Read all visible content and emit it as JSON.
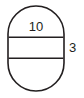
{
  "figure": {
    "shape_name": "stadium-oval",
    "stroke_color": "#231f20",
    "fill_color": "#ffffff",
    "background_color": "#ffffff",
    "stroke_width": 1.6,
    "geometry": {
      "left": 8,
      "right": 64,
      "top": 6,
      "bottom": 91,
      "width": 56,
      "height": 85,
      "cap_radius": 28,
      "band_top_y": 37,
      "band_bottom_y": 58,
      "band_height": 21
    },
    "labels": {
      "width_label": {
        "text": "10",
        "name": "width-dimension-label",
        "x": 36,
        "y": 28,
        "position": "inside-top"
      },
      "band_label": {
        "text": "3",
        "name": "band-height-dimension-label",
        "x": 69,
        "y": 49,
        "position": "outside-right"
      }
    }
  }
}
